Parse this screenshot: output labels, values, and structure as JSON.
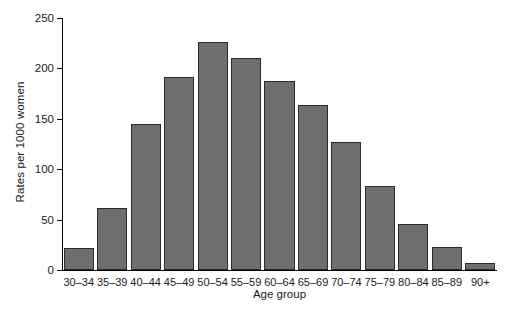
{
  "chart_data": {
    "type": "bar",
    "title": "",
    "xlabel": "Age group",
    "ylabel": "Rates per 1000 women",
    "categories": [
      "30–34",
      "35–39",
      "40–44",
      "45–49",
      "50–54",
      "55–59",
      "60–64",
      "65–69",
      "70–74",
      "75–79",
      "80–84",
      "85–89",
      "90+"
    ],
    "values": [
      22,
      62,
      145,
      191,
      226,
      210,
      188,
      164,
      127,
      83,
      46,
      23,
      7
    ],
    "ylim": [
      0,
      250
    ],
    "yticks": [
      0,
      50,
      100,
      150,
      200,
      250
    ],
    "ytick_labels": [
      "0",
      "50",
      "100",
      "150",
      "200",
      "250"
    ],
    "grid": false,
    "legend": false,
    "bar_color": "#6e6e6e",
    "bar_edge_color": "#2b2b2b",
    "axis_color": "#000000"
  }
}
